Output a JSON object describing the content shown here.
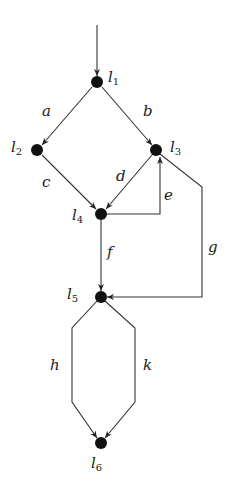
{
  "diagram": {
    "type": "control-flow-graph",
    "colors": {
      "node": "#111111",
      "edge": "#333333",
      "text": "#1a1a1a",
      "background": "#ffffff"
    },
    "nodes": [
      {
        "id": "l1",
        "base": "l",
        "sub": "1",
        "x": 97,
        "y": 82,
        "label_x": 108,
        "label_y": 78
      },
      {
        "id": "l2",
        "base": "l",
        "sub": "2",
        "x": 37,
        "y": 150,
        "label_x": 11,
        "label_y": 148
      },
      {
        "id": "l3",
        "base": "l",
        "sub": "3",
        "x": 156,
        "y": 150,
        "label_x": 170,
        "label_y": 148
      },
      {
        "id": "l4",
        "base": "l",
        "sub": "4",
        "x": 101,
        "y": 214,
        "label_x": 72,
        "label_y": 220
      },
      {
        "id": "l5",
        "base": "l",
        "sub": "5",
        "x": 101,
        "y": 297,
        "label_x": 66,
        "label_y": 297
      },
      {
        "id": "l6",
        "base": "l",
        "sub": "6",
        "x": 101,
        "y": 443,
        "label_x": 90,
        "label_y": 470
      }
    ],
    "edges": [
      {
        "id": "entry",
        "label": "",
        "from": "entry",
        "to": "l1"
      },
      {
        "id": "a",
        "label": "a",
        "from": "l1",
        "to": "l2",
        "label_x": 43,
        "label_y": 114
      },
      {
        "id": "b",
        "label": "b",
        "from": "l1",
        "to": "l3",
        "label_x": 143,
        "label_y": 114
      },
      {
        "id": "c",
        "label": "c",
        "from": "l2",
        "to": "l4",
        "label_x": 43,
        "label_y": 185
      },
      {
        "id": "d",
        "label": "d",
        "from": "l3",
        "to": "l4",
        "label_x": 117,
        "label_y": 180
      },
      {
        "id": "e",
        "label": "e",
        "from": "l4",
        "to": "l3",
        "label_x": 164,
        "label_y": 199
      },
      {
        "id": "f",
        "label": "f",
        "from": "l4",
        "to": "l5",
        "label_x": 107,
        "label_y": 257
      },
      {
        "id": "g",
        "label": "g",
        "from": "l3",
        "to": "l5",
        "label_x": 209,
        "label_y": 253
      },
      {
        "id": "h",
        "label": "h",
        "from": "l5",
        "to": "l6",
        "label_x": 52,
        "label_y": 370
      },
      {
        "id": "k",
        "label": "k",
        "from": "l5",
        "to": "l6",
        "label_x": 144,
        "label_y": 370
      }
    ]
  }
}
